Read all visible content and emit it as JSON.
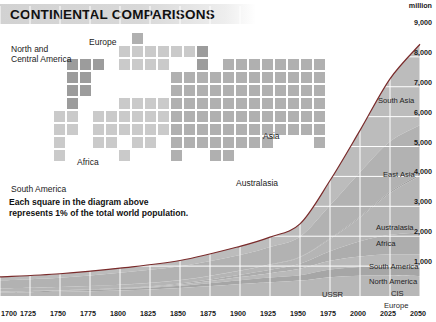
{
  "header": {
    "title": "CONTINENTAL COMPARISONS"
  },
  "square_diagram": {
    "caption": "Each square in the diagram above represents 1% of the total world population.",
    "labels": [
      {
        "name": "north-central-america",
        "text": "North and",
        "x": 11,
        "y": 44
      },
      {
        "name": "north-central-america-2",
        "text": "Central America",
        "x": 11,
        "y": 54
      },
      {
        "name": "europe",
        "text": "Europe",
        "x": 89,
        "y": 37
      },
      {
        "name": "africa",
        "text": "Africa",
        "x": 77,
        "y": 157
      },
      {
        "name": "asia",
        "text": "Asia",
        "x": 263,
        "y": 131
      },
      {
        "name": "australasia",
        "text": "Australasia",
        "x": 236,
        "y": 178
      },
      {
        "name": "south-america",
        "text": "South America",
        "x": 11,
        "y": 184
      }
    ]
  },
  "chart_data": {
    "type": "area",
    "unit_label": "million",
    "xlabel": "",
    "ylabel": "million",
    "xlim": [
      1700,
      2050
    ],
    "ylim": [
      0,
      9500
    ],
    "grid": true,
    "legend": "inline-band-labels",
    "x_ticks": [
      1700,
      1725,
      1750,
      1775,
      1800,
      1825,
      1850,
      1875,
      1900,
      1925,
      1950,
      1975,
      2000,
      2025,
      2050
    ],
    "y_ticks": [
      1000,
      2000,
      3000,
      4000,
      5000,
      6000,
      7000,
      8000,
      9000
    ],
    "y_tick_labels": [
      "1,000",
      "2,000",
      "3,000",
      "4,000",
      "5,000",
      "6,000",
      "7,000",
      "8,000",
      "9,000"
    ],
    "x": [
      1700,
      1750,
      1800,
      1850,
      1900,
      1925,
      1950,
      1975,
      2000,
      2025,
      2050
    ],
    "series": [
      {
        "name": "Europe",
        "values": [
          115,
          140,
          180,
          265,
          400,
          460,
          515,
          630,
          680,
          690,
          660
        ]
      },
      {
        "name": "CIS",
        "values": [
          25,
          35,
          50,
          80,
          130,
          160,
          180,
          255,
          290,
          300,
          295
        ]
      },
      {
        "name": "North America",
        "values": [
          5,
          8,
          16,
          40,
          105,
          145,
          215,
          290,
          350,
          405,
          440
        ]
      },
      {
        "name": "South America",
        "values": [
          10,
          13,
          20,
          33,
          75,
          110,
          165,
          320,
          510,
          650,
          730
        ]
      },
      {
        "name": "Africa",
        "values": [
          100,
          105,
          110,
          110,
          135,
          175,
          225,
          415,
          800,
          1400,
          1900
        ]
      },
      {
        "name": "Australasia",
        "values": [
          3,
          3,
          3,
          4,
          7,
          10,
          13,
          22,
          31,
          40,
          46
        ]
      },
      {
        "name": "East Asia",
        "values": [
          265,
          310,
          400,
          460,
          520,
          580,
          670,
          1100,
          1480,
          1680,
          1650
        ]
      },
      {
        "name": "South Asia",
        "values": [
          115,
          130,
          155,
          195,
          290,
          330,
          430,
          830,
          1400,
          2100,
          2700
        ]
      }
    ],
    "total_line": {
      "name": "World total",
      "color": "#7a2b2b",
      "values": [
        638,
        744,
        934,
        1187,
        1662,
        1970,
        2413,
        3862,
        5541,
        7265,
        8421
      ]
    },
    "band_labels": [
      {
        "text": "South Asia",
        "x": 378,
        "y": 96
      },
      {
        "text": "East Asia",
        "x": 383,
        "y": 170
      },
      {
        "text": "Australasia",
        "x": 376,
        "y": 223
      },
      {
        "text": "Africa",
        "x": 376,
        "y": 239
      },
      {
        "text": "South America",
        "x": 369,
        "y": 262
      },
      {
        "text": "North America",
        "x": 369,
        "y": 277
      },
      {
        "text": "CIS",
        "x": 391,
        "y": 289
      },
      {
        "text": "Europe",
        "x": 384,
        "y": 301
      },
      {
        "text": "USSR",
        "x": 322,
        "y": 290
      }
    ]
  },
  "colors": {
    "title_bar": "#d4d4d4",
    "square_light": "#c9c9c9",
    "square_mid": "#b5b5b5",
    "square_dark": "#9b9b9b",
    "chart_line": "#7a2b2b",
    "text": "#1a1a1a"
  }
}
